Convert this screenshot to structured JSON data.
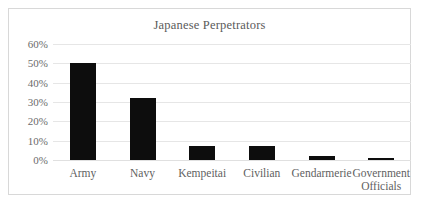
{
  "chart_data": {
    "type": "bar",
    "title": "Japanese Perpetrators",
    "xlabel": "",
    "ylabel": "",
    "categories": [
      "Army",
      "Navy",
      "Kempeitai",
      "Civilian",
      "Gendarmerie",
      "Government Officials"
    ],
    "values": [
      50,
      32,
      7,
      7,
      2,
      0.5
    ],
    "value_labels": [
      "50%",
      "32%",
      "7%",
      "7%",
      "2%",
      "0.5%"
    ],
    "ylim": [
      0,
      60
    ],
    "ytick_labels": [
      "60%",
      "50%",
      "40%",
      "30%",
      "20%",
      "10%",
      "0%"
    ],
    "ytick_values": [
      60,
      50,
      40,
      30,
      20,
      10,
      0
    ],
    "grid": true,
    "legend": false,
    "bar_color": "#0d0d0d",
    "grid_color": "#e6e6e6",
    "frame_color": "#d8d8d8",
    "text_color": "#5f5f5f",
    "title_color": "#5a5a5a",
    "background": "#ffffff"
  }
}
